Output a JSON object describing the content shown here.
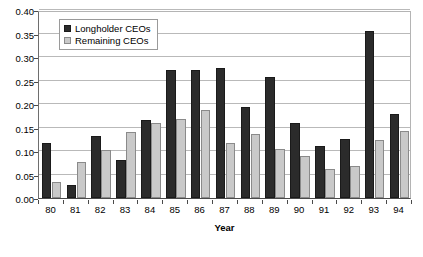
{
  "chart_data": {
    "type": "bar",
    "title": "",
    "xlabel": "Year",
    "ylabel": "",
    "ylim": [
      0.0,
      0.4
    ],
    "ytick_labels": [
      "0.00",
      "0.05",
      "0.10",
      "0.15",
      "0.20",
      "0.25",
      "0.30",
      "0.35",
      "0.40"
    ],
    "ytick_values": [
      0.0,
      0.05,
      0.1,
      0.15,
      0.2,
      0.25,
      0.3,
      0.35,
      0.4
    ],
    "grid": true,
    "legend_position": "upper-left-inside",
    "categories": [
      "80",
      "81",
      "82",
      "83",
      "84",
      "85",
      "86",
      "87",
      "88",
      "89",
      "90",
      "91",
      "92",
      "93",
      "94"
    ],
    "series": [
      {
        "name": "Longholder CEOs",
        "color": "#2b2b2b",
        "values": [
          0.117,
          0.028,
          0.133,
          0.08,
          0.165,
          0.272,
          0.272,
          0.277,
          0.193,
          0.258,
          0.16,
          0.11,
          0.125,
          0.355,
          0.178
        ]
      },
      {
        "name": "Remaining CEOs",
        "color": "#c9c9c9",
        "values": [
          0.035,
          0.077,
          0.102,
          0.14,
          0.16,
          0.168,
          0.188,
          0.118,
          0.136,
          0.105,
          0.09,
          0.062,
          0.068,
          0.123,
          0.142
        ]
      }
    ]
  },
  "legend": {
    "items": [
      {
        "label": "Longholder CEOs"
      },
      {
        "label": "Remaining CEOs"
      }
    ]
  },
  "axis": {
    "x_title": "Year"
  }
}
